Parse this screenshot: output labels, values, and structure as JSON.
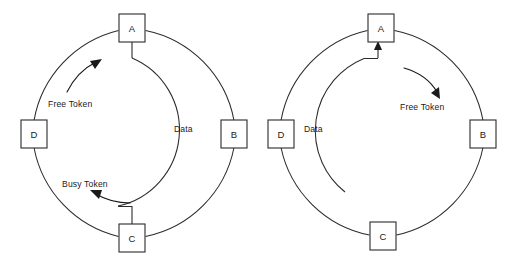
{
  "figure": {
    "width": 506,
    "height": 264,
    "background_color": "#ffffff",
    "line_color": "#2b2b2b",
    "text_color": "#1a1a1a"
  },
  "diagrams": [
    {
      "id": "left",
      "name": "busy-token-ring",
      "center": {
        "x": 134,
        "y": 134
      },
      "outer_radius": 113,
      "inner_radius": 78,
      "nodes": [
        {
          "id": "A",
          "label": "A",
          "position": "top",
          "cx": 132,
          "cy": 28,
          "w": 26,
          "h": 28
        },
        {
          "id": "B",
          "label": "B",
          "position": "right",
          "cx": 234,
          "cy": 134,
          "w": 26,
          "h": 28
        },
        {
          "id": "C",
          "label": "C",
          "position": "bottom",
          "cx": 132,
          "cy": 238,
          "w": 26,
          "h": 28
        },
        {
          "id": "D",
          "label": "D",
          "position": "left",
          "cx": 34,
          "cy": 134,
          "w": 26,
          "h": 28
        }
      ],
      "annotations": [
        {
          "id": "free-token",
          "text": "Free Token",
          "x": 48,
          "y": 107,
          "anchor": "start"
        },
        {
          "id": "data",
          "text": "Data",
          "x": 174,
          "y": 132,
          "anchor": "start"
        },
        {
          "id": "busy-token",
          "text": "Busy Token",
          "x": 62,
          "y": 190,
          "anchor": "start"
        }
      ],
      "arrows": [
        {
          "id": "free-token-arrow",
          "direction": "clockwise",
          "label_ref": "free-token"
        },
        {
          "id": "busy-token-arrow",
          "direction": "counterclockwise",
          "label_ref": "busy-token"
        }
      ],
      "data_path": {
        "id": "data-arc",
        "description": "inner arc from node A clockwise to node C",
        "from": "A",
        "to": "C",
        "arrowhead": "none"
      }
    },
    {
      "id": "right",
      "name": "free-token-ring",
      "center": {
        "x": 383,
        "y": 134
      },
      "outer_radius": 113,
      "inner_radius": 78,
      "nodes": [
        {
          "id": "A",
          "label": "A",
          "position": "top",
          "cx": 381,
          "cy": 28,
          "w": 26,
          "h": 28
        },
        {
          "id": "B",
          "label": "B",
          "position": "right",
          "cx": 483,
          "cy": 134,
          "w": 26,
          "h": 28
        },
        {
          "id": "C",
          "label": "C",
          "position": "bottom",
          "cx": 383,
          "cy": 236,
          "w": 26,
          "h": 28
        },
        {
          "id": "D",
          "label": "D",
          "position": "left",
          "cx": 281,
          "cy": 134,
          "w": 26,
          "h": 28
        }
      ],
      "annotations": [
        {
          "id": "free-token",
          "text": "Free Token",
          "x": 400,
          "y": 107,
          "anchor": "start"
        },
        {
          "id": "data",
          "text": "Data",
          "x": 304,
          "y": 132,
          "anchor": "start"
        }
      ],
      "arrows": [
        {
          "id": "free-token-arrow",
          "direction": "clockwise",
          "label_ref": "free-token"
        }
      ],
      "data_path": {
        "id": "data-arc",
        "description": "inner arc terminating at node A with arrowhead",
        "from": "ring",
        "to": "A",
        "arrowhead": "up-into-A"
      }
    }
  ]
}
